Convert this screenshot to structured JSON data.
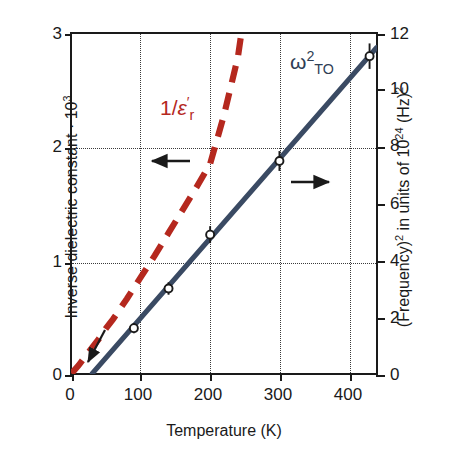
{
  "figure": {
    "xlabel": "Temperature (K)",
    "ylabel_left": "Inverse dielectric constant · 10",
    "ylabel_left_exp": "3",
    "ylabel_right_a": "(Frequency)",
    "ylabel_right_a_exp": "2",
    "ylabel_right_b": " in units of 10",
    "ylabel_right_b_exp": "24",
    "ylabel_right_c": " (Hz)",
    "ylabel_right_c_exp": "2"
  },
  "annotations": {
    "eps_num": "1/",
    "eps_sym": "ε",
    "eps_prime": "′",
    "eps_sub": "r",
    "omega_sym": "ω",
    "omega_sup": "2",
    "omega_sub": "TO",
    "arrow_left": "left-arrow",
    "arrow_right": "right-arrow",
    "arrow_origin": "origin-pointer-arrow"
  },
  "colors": {
    "red_dashed": "#b5281e",
    "blue_solid": "#3a4a63",
    "axis": "#1a1a1a",
    "grid": "#3a3a3a",
    "background": "#ffffff"
  },
  "chart_data": {
    "type": "line",
    "title": "",
    "xlabel": "Temperature (K)",
    "ylabel": "Inverse dielectric constant · 10^3",
    "ylabel_right": "(Frequency)^2 in units of 10^24 (Hz)^2",
    "xlim": [
      0,
      440
    ],
    "ylim": [
      0,
      3
    ],
    "ylim_right": [
      0,
      12
    ],
    "xticks": [
      0,
      100,
      200,
      300,
      400
    ],
    "yticks_left": [
      0,
      1,
      2,
      3
    ],
    "yticks_right": [
      0,
      2,
      4,
      6,
      8,
      10,
      12
    ],
    "grid": "dotted vertical at 100,200,300,400; dotted horizontal at left 1 and 2",
    "legend": "inline curve labels",
    "series": [
      {
        "name": "1/ε'r",
        "axis": "left",
        "style": "dashed",
        "color": "#b5281e",
        "markers": false,
        "x": [
          0,
          10,
          20,
          30,
          40,
          50,
          60,
          80,
          100,
          120,
          140,
          160,
          180,
          200,
          220,
          240,
          245
        ],
        "y": [
          0.0,
          0.07,
          0.15,
          0.23,
          0.31,
          0.4,
          0.48,
          0.66,
          0.85,
          1.04,
          1.24,
          1.44,
          1.64,
          1.85,
          2.28,
          2.79,
          3.0
        ]
      },
      {
        "name": "ω²TO",
        "axis": "right",
        "style": "solid",
        "color": "#3a4a63",
        "markers": true,
        "marker": "open-circle",
        "fit_x": [
          30,
          440
        ],
        "fit_y": [
          0.0,
          11.5
        ],
        "x": [
          90,
          140,
          200,
          300,
          430
        ],
        "y": [
          1.6,
          3.0,
          4.9,
          7.5,
          11.2
        ],
        "yerr": [
          0.18,
          0.22,
          0.3,
          0.35,
          0.45
        ]
      }
    ]
  }
}
